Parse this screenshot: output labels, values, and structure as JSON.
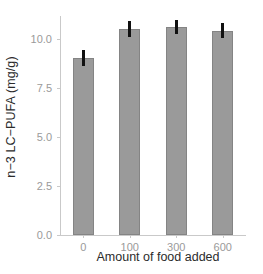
{
  "chart_data": {
    "type": "bar",
    "title": "",
    "xlabel": "Amount of food added",
    "ylabel": "n−3 LC−PUFA (mg/g)",
    "categories": [
      "0",
      "100",
      "300",
      "600"
    ],
    "values": [
      9.05,
      10.55,
      10.65,
      10.45
    ],
    "errors": [
      0.4,
      0.4,
      0.35,
      0.4
    ],
    "error_type": "symmetric",
    "ylim": [
      0.0,
      11.2
    ],
    "y_ticks": [
      "0.0",
      "2.5",
      "5.0",
      "7.5",
      "10.0"
    ],
    "y_tick_values": [
      0.0,
      2.5,
      5.0,
      7.5,
      10.0
    ],
    "grid": false,
    "legend": false,
    "bar_fill_color": "#9a9a9a",
    "bar_border_color": "#848484",
    "errorbar_color": "#111111",
    "axis_color": "#c9c9c9",
    "tick_label_color": "#9a9a9a",
    "axis_title_color": "#2b2b2b",
    "background_color": "#ffffff"
  }
}
